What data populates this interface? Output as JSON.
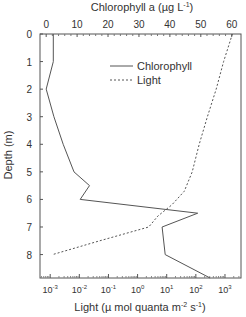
{
  "chart_data": {
    "type": "line",
    "title": "",
    "top_axis": {
      "label": "Chlorophyll a (µg L",
      "label_sup": "-1",
      "label_end": ")",
      "range": [
        -2,
        63
      ],
      "ticks": [
        0,
        10,
        20,
        30,
        40,
        50,
        60
      ],
      "tick_labels": [
        "0",
        "10",
        "20",
        "30",
        "40",
        "50",
        "60"
      ]
    },
    "bottom_axis": {
      "label": "Light (µ mol quanta m",
      "label_sup1": "-2",
      "label_mid": " s",
      "label_sup2": "-1",
      "label_end": ")",
      "scale": "log",
      "range_exp": [
        -3.35,
        3.55
      ],
      "ticks_exp": [
        -3,
        -2,
        -1,
        0,
        1,
        2,
        3
      ],
      "tick_base": "10"
    },
    "y_axis": {
      "label": "Depth (m)",
      "range": [
        0,
        8.85
      ],
      "inverted": true,
      "ticks": [
        0,
        1,
        2,
        3,
        4,
        5,
        6,
        7,
        8
      ],
      "tick_labels": [
        "0",
        "1",
        "2",
        "3",
        "4",
        "5",
        "6",
        "7",
        "8"
      ]
    },
    "legend": {
      "position": "top-right",
      "entries": [
        {
          "name": "Chlorophyll",
          "style": "solid"
        },
        {
          "name": "Light",
          "style": "dashed"
        }
      ]
    },
    "series": [
      {
        "name": "Chlorophyll",
        "axis": "top",
        "points": [
          {
            "depth": 0,
            "value": 2.3
          },
          {
            "depth": 1,
            "value": 2.3
          },
          {
            "depth": 2,
            "value": 0
          },
          {
            "depth": 3,
            "value": 2.5
          },
          {
            "depth": 4,
            "value": 5.5
          },
          {
            "depth": 5,
            "value": 9
          },
          {
            "depth": 5.5,
            "value": 14
          },
          {
            "depth": 6,
            "value": 11
          },
          {
            "depth": 6.5,
            "value": 49
          },
          {
            "depth": 7,
            "value": 37.5
          },
          {
            "depth": 8,
            "value": 38.5
          },
          {
            "depth": 8.85,
            "value": 53
          }
        ]
      },
      {
        "name": "Light",
        "axis": "bottom",
        "points": [
          {
            "depth": 0,
            "value": 1800
          },
          {
            "depth": 1,
            "value": 900
          },
          {
            "depth": 2,
            "value": 500
          },
          {
            "depth": 3,
            "value": 250
          },
          {
            "depth": 4,
            "value": 130
          },
          {
            "depth": 5,
            "value": 75
          },
          {
            "depth": 5.7,
            "value": 40
          },
          {
            "depth": 6.2,
            "value": 15
          },
          {
            "depth": 6.6,
            "value": 5
          },
          {
            "depth": 7,
            "value": 2.4
          },
          {
            "depth": 7.5,
            "value": 0.05
          },
          {
            "depth": 8,
            "value": 0.0012
          }
        ]
      }
    ]
  }
}
